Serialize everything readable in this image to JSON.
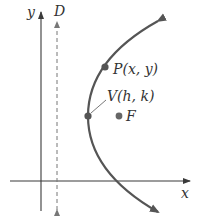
{
  "diagram": {
    "axes": {
      "x_label": "x",
      "y_label": "y"
    },
    "directrix": {
      "label": "D",
      "style": "dashed"
    },
    "points": {
      "P": {
        "label": "P(x, y)"
      },
      "V": {
        "label": "V(h, k)"
      },
      "F": {
        "label": "F"
      }
    },
    "colors": {
      "axis": "#3a3a3a",
      "curve": "#555555",
      "dashed": "#777777",
      "text": "#333333"
    }
  }
}
